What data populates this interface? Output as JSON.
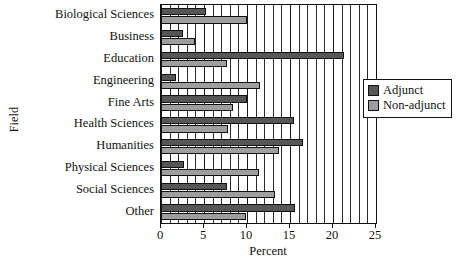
{
  "chart_data": {
    "type": "bar",
    "orientation": "horizontal",
    "title": "",
    "xlabel": "Percent",
    "ylabel": "Field",
    "xlim": [
      0,
      25
    ],
    "xticks": [
      0,
      5,
      10,
      15,
      20,
      25
    ],
    "xtick_labels": [
      "0",
      "5",
      "10",
      "15",
      "20",
      "25"
    ],
    "grid": true,
    "grid_axis": "x",
    "minor_gridline_step": 1,
    "legend_position": "right",
    "categories": [
      "Biological Sciences",
      "Business",
      "Education",
      "Engineering",
      "Fine Arts",
      "Health Sciences",
      "Humanities",
      "Physical Sciences",
      "Social Sciences",
      "Other"
    ],
    "series": [
      {
        "name": "Adjunct",
        "color": "#565656",
        "values": [
          5.2,
          2.6,
          21.3,
          1.7,
          10.0,
          15.5,
          16.5,
          2.7,
          7.7,
          15.6
        ]
      },
      {
        "name": "Non-adjunct",
        "color": "#9e9e9e",
        "values": [
          10.0,
          4.0,
          7.7,
          11.5,
          8.4,
          7.8,
          13.7,
          11.4,
          13.3,
          9.9
        ]
      }
    ]
  },
  "legend": {
    "entries": [
      {
        "label": "Adjunct",
        "swatch": "adjunct"
      },
      {
        "label": "Non-adjunct",
        "swatch": "nonadjunct"
      }
    ]
  }
}
